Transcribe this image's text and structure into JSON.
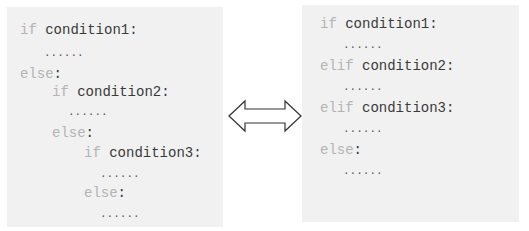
{
  "left_code": {
    "lines": [
      {
        "kw": "if",
        "cond": " condition1:",
        "x": 20,
        "y": 22
      },
      {
        "dots": "......",
        "x": 44,
        "y": 44
      },
      {
        "kw": "else",
        "cond": ":",
        "x": 20,
        "y": 66
      },
      {
        "kw": "if",
        "cond": " condition2:",
        "x": 52,
        "y": 84
      },
      {
        "dots": "......",
        "x": 68,
        "y": 103
      },
      {
        "kw": "else",
        "cond": ":",
        "x": 52,
        "y": 125
      },
      {
        "kw": "if",
        "cond": " condition3:",
        "x": 84,
        "y": 145
      },
      {
        "dots": "......",
        "x": 100,
        "y": 165
      },
      {
        "kw": "else",
        "cond": ":",
        "x": 84,
        "y": 185
      },
      {
        "dots": "......",
        "x": 100,
        "y": 205
      }
    ]
  },
  "right_code": {
    "lines": [
      {
        "kw": "if",
        "cond": " condition1:",
        "x": 320,
        "y": 16
      },
      {
        "dots": "......",
        "x": 343,
        "y": 36
      },
      {
        "kw": "elif",
        "cond": " condition2:",
        "x": 320,
        "y": 58
      },
      {
        "dots": "......",
        "x": 343,
        "y": 78
      },
      {
        "kw": "elif",
        "cond": " condition3:",
        "x": 320,
        "y": 100
      },
      {
        "dots": "......",
        "x": 343,
        "y": 120
      },
      {
        "kw": "else",
        "cond": ":",
        "x": 320,
        "y": 142
      },
      {
        "dots": "......",
        "x": 343,
        "y": 162
      }
    ]
  },
  "arrow": {
    "icon": "double-arrow-icon",
    "stroke": "#333333"
  },
  "colors": {
    "box_bg": "#f1f1f1",
    "keyword": "#b4b4b4",
    "text": "#3a3a3a"
  }
}
